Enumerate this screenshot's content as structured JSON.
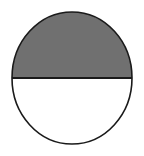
{
  "figure": {
    "name": "half-shaded-circle",
    "canvas": {
      "width": 144,
      "height": 156,
      "background_color": "#ffffff"
    },
    "circle": {
      "center_x": 72,
      "center_y": 78,
      "radius_x": 60,
      "radius_y": 66,
      "outline_color": "#1a1a1a",
      "outline_width": 1.6
    },
    "upper_half": {
      "label": "shaded upper semicircle",
      "fill_color": "#707070",
      "fraction": "1/2"
    },
    "lower_half": {
      "label": "unshaded lower semicircle",
      "fill_color": "#ffffff",
      "fraction": "1/2"
    },
    "diameter_line": {
      "label": "horizontal diameter",
      "y": 78,
      "x_start": 12,
      "x_end": 132,
      "color": "#1a1a1a",
      "width": 2.2
    }
  }
}
